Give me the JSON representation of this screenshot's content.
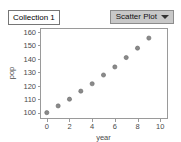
{
  "collection": {
    "label": "Collection 1"
  },
  "plot_type_menu": {
    "label": "Scatter Plot",
    "caret_icon": "chevron-down-icon"
  },
  "chart_data": {
    "type": "scatter",
    "title": "",
    "xlabel": "year",
    "ylabel": "pop",
    "xlim": [
      -0.6,
      10.6
    ],
    "ylim": [
      96,
      163
    ],
    "xticks": [
      0,
      2,
      4,
      6,
      8,
      10
    ],
    "yticks": [
      100,
      110,
      120,
      130,
      140,
      150,
      160
    ],
    "xticklabels": [
      "0",
      "2",
      "4",
      "6",
      "8",
      "10"
    ],
    "yticklabels": [
      "100",
      "110",
      "120",
      "130",
      "140",
      "150",
      "160"
    ],
    "grid": false,
    "legend": null,
    "series": [
      {
        "name": "pop",
        "marker": "circle",
        "color": "#8a8a8a",
        "x": [
          0,
          1,
          2,
          3,
          4,
          5,
          6,
          7,
          8,
          9
        ],
        "y": [
          100,
          105,
          110,
          116,
          121.5,
          128,
          134,
          141,
          148,
          155.5
        ]
      }
    ]
  },
  "colors": {
    "dropdown_background": "#c8c8c8",
    "axis": "#9a9a9a",
    "point": "#8a8a8a",
    "text": "#4a4a4a"
  }
}
